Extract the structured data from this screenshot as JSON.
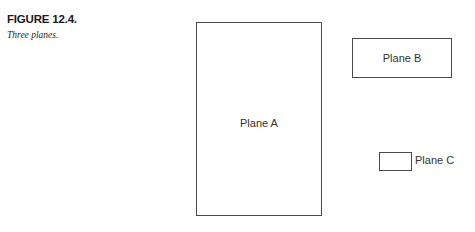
{
  "figure": {
    "caption_title": "FIGURE 12.4.",
    "caption_subtitle": "Three planes."
  },
  "diagram": {
    "shapes": [
      {
        "id": "plane-a",
        "label": "Plane A",
        "label_position": "inside",
        "shape": "rectangle",
        "orientation": "portrait"
      },
      {
        "id": "plane-b",
        "label": "Plane B",
        "label_position": "inside",
        "shape": "rectangle",
        "orientation": "landscape"
      },
      {
        "id": "plane-c",
        "label": "Plane C",
        "label_position": "right-outside",
        "shape": "rectangle",
        "orientation": "landscape"
      }
    ]
  },
  "colors": {
    "background": "#ffffff",
    "stroke": "#4a4a4a",
    "label_text": "#333333",
    "caption_text": "#1a1a1a"
  }
}
